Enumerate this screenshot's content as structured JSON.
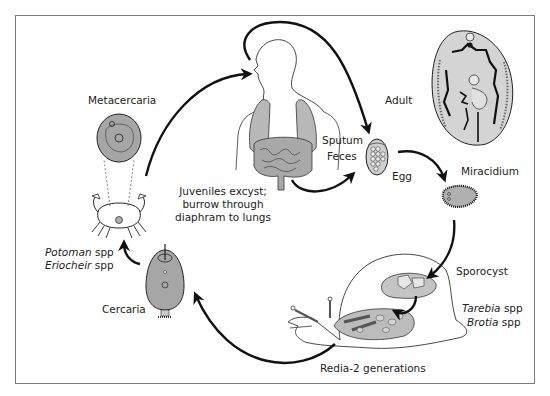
{
  "diagram": {
    "colors": {
      "fill_gray": "#b8b8b8",
      "dark_gray": "#8c8c8c",
      "light_gray": "#d4d4d4",
      "line": "#111111",
      "frame": "#7a7a7a"
    },
    "labels": {
      "metacercaria": "Metacercaria",
      "adult": "Adult",
      "sputum": "Sputum",
      "feces": "Feces",
      "egg": "Egg",
      "miracidium": "Miracidium",
      "sporocyst": "Sporocyst",
      "snail_host_1_genus": "Tarebia",
      "snail_host_1_suffix": " spp",
      "snail_host_2_genus": "Brotia",
      "snail_host_2_suffix": " spp",
      "redia": "Redia-2 generations",
      "cercaria": "Cercaria",
      "crab_host_1_genus": "Potoman",
      "crab_host_1_suffix": " spp",
      "crab_host_2_genus": "Eriocheir",
      "crab_host_2_suffix": " spp",
      "juveniles_line1": "Juveniles excyst;",
      "juveniles_line2": "burrow through",
      "juveniles_line3": "diaphram to lungs"
    },
    "stages": [
      "Metacercaria",
      "Adult",
      "Egg",
      "Miracidium",
      "Sporocyst",
      "Redia-2 generations",
      "Cercaria"
    ],
    "hosts": {
      "definitive": "Human",
      "first_intermediate": [
        "Tarebia spp",
        "Brotia spp"
      ],
      "second_intermediate": [
        "Potoman spp",
        "Eriocheir spp"
      ]
    }
  }
}
